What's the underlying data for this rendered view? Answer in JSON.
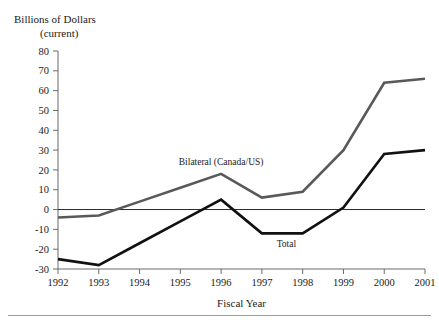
{
  "figure": {
    "y_axis_title_line1": "Billions of Dollars",
    "y_axis_title_line2": "(current)",
    "x_axis_label": "Fiscal Year"
  },
  "annotations": {
    "bilateral_label": "Bilateral (Canada/US)",
    "total_label": "Total"
  },
  "colors": {
    "bilateral": "#595959",
    "total": "#111111",
    "axis": "#6b6b6b",
    "zero_line": "#2a2a2a",
    "background": "#ffffff"
  },
  "chart_data": {
    "type": "line",
    "title": "",
    "subtitle": "",
    "xlabel": "Fiscal Year",
    "ylabel": "Billions of Dollars (current)",
    "x": [
      1992,
      1993,
      1994,
      1995,
      1996,
      1997,
      1998,
      1999,
      2000,
      2001
    ],
    "categories": [
      "1992",
      "1993",
      "1994",
      "1995",
      "1996",
      "1997",
      "1998",
      "1999",
      "2000",
      "2001"
    ],
    "xlim": [
      1992,
      2001
    ],
    "ylim": [
      -30,
      80
    ],
    "ytick_values": [
      -30,
      -20,
      -10,
      0,
      10,
      20,
      30,
      40,
      50,
      60,
      70,
      80
    ],
    "ytick_labels": [
      "-30",
      "-20",
      "-10",
      "0",
      "10",
      "20",
      "30",
      "40",
      "50",
      "60",
      "70",
      "80"
    ],
    "xtick_labels": [
      "1992",
      "1993",
      "1994",
      "1995",
      "1996",
      "1997",
      "1998",
      "1999",
      "2000",
      "2001"
    ],
    "grid": false,
    "legend": "inline-annotations",
    "zero_reference_line": 0,
    "series": [
      {
        "name": "Bilateral (Canada/US)",
        "color": "#595959",
        "linewidth": 2.6,
        "values": [
          -4,
          -3,
          4,
          11,
          18,
          6,
          9,
          30,
          64,
          66
        ]
      },
      {
        "name": "Total",
        "color": "#111111",
        "linewidth": 2.6,
        "values": [
          -25,
          -28,
          -17,
          -6,
          5,
          -12,
          -12,
          1,
          28,
          30
        ]
      }
    ]
  }
}
